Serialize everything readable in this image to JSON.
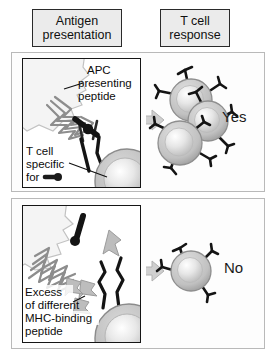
{
  "figure": {
    "columns": [
      {
        "id": "antigen-presentation",
        "line1": "Antigen",
        "line2": "presentation"
      },
      {
        "id": "t-cell-response",
        "line1": "T cell",
        "line2": "response"
      }
    ]
  },
  "rows": [
    {
      "id": "specific-peptide",
      "verdict": "Yes",
      "arrow": "arrow-right",
      "labels": {
        "apc_line1": "APC",
        "apc_line2": "presenting",
        "apc_line3": "peptide",
        "tcell_line1": "T cell",
        "tcell_line2": "specific",
        "tcell_line3": "for"
      },
      "response_cells": 3
    },
    {
      "id": "excess-different-peptide",
      "verdict": "No",
      "arrow": "arrow-right",
      "labels": {
        "excess_line1": "Excess",
        "excess_line2": "of different",
        "excess_line3": "MHC-binding",
        "excess_line4": "peptide"
      },
      "response_cells": 1
    }
  ],
  "icons": {
    "peptide_swatch": "peptide-icon",
    "arrow": "arrow-right-icon",
    "apc": "apc-cell-icon",
    "mhc": "mhc-molecule-icon",
    "tcr": "t-cell-receptor-icon",
    "tcell": "t-cell-icon"
  },
  "colors": {
    "header_fill": "#ebebeb",
    "header_border": "#2a2a2a",
    "panel_border": "#151515",
    "row_border": "#b9b9b9",
    "apc_fill": "#f2f2f2",
    "mhc_stroke": "#8f8f8f",
    "peptide_dark": "#1b1b1b",
    "peptide_gray": "#b0b0b0",
    "tcell_rim": "#a8a8a8",
    "tcell_core": "#e4e4e4",
    "arrow_fill": "#cfcfcf",
    "text": "#101010"
  }
}
